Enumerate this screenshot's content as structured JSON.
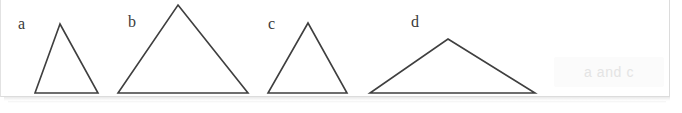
{
  "figure": {
    "background_color": "#ffffff",
    "card_border_color": "#dcdcdc",
    "stroke_color": "#3f3f3f",
    "stroke_width": 1.6,
    "shapes": [
      {
        "id": "triangle-a",
        "label": "a",
        "type": "triangle",
        "points": "60,24 98,93 35,93",
        "label_position": {
          "x": 18,
          "y": 16
        }
      },
      {
        "id": "triangle-b",
        "label": "b",
        "type": "triangle",
        "points": "178,5 248,93 118,93",
        "label_position": {
          "x": 128,
          "y": 14
        }
      },
      {
        "id": "triangle-c",
        "label": "c",
        "type": "triangle",
        "points": "308,23 347,93 268,93",
        "label_position": {
          "x": 268,
          "y": 16
        }
      },
      {
        "id": "triangle-d",
        "label": "d",
        "type": "triangle",
        "points": "448,39 535,93 370,93",
        "label_position": {
          "x": 411,
          "y": 14
        }
      }
    ]
  },
  "answer": {
    "text": "a and c",
    "text_color": "#e4e4e4",
    "chip_color": "#fbfbfb"
  }
}
